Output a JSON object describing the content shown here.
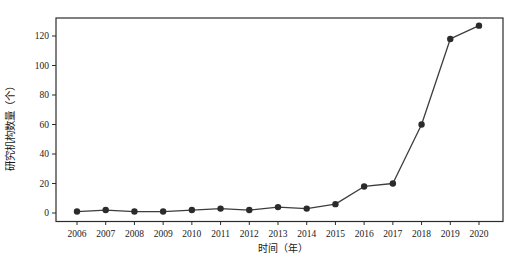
{
  "chart_data": {
    "type": "line",
    "title": "",
    "xlabel": "时间（年）",
    "ylabel": "研究机构数量（个）",
    "categories": [
      "2006",
      "2007",
      "2008",
      "2009",
      "2010",
      "2011",
      "2012",
      "2013",
      "2014",
      "2015",
      "2016",
      "2017",
      "2018",
      "2019",
      "2020"
    ],
    "x": [
      2006,
      2007,
      2008,
      2009,
      2010,
      2011,
      2012,
      2013,
      2014,
      2015,
      2016,
      2017,
      2018,
      2019,
      2020
    ],
    "series": [
      {
        "name": "研究机构数量",
        "values": [
          1,
          2,
          1,
          1,
          2,
          3,
          2,
          4,
          3,
          6,
          18,
          20,
          60,
          118,
          127
        ]
      }
    ],
    "yticks": [
      0,
      20,
      40,
      60,
      80,
      100,
      120
    ],
    "ylim": [
      -6,
      132
    ],
    "xlim": [
      2005.27,
      2020.84
    ],
    "grid": false,
    "legend": "none",
    "marker": "filled-circle",
    "colors": {
      "line": "#3d3d3d",
      "marker": "#2b2b2b",
      "frame": "#2b2b2b",
      "tick": "#2b2b2b",
      "text": "#1a1a1a",
      "background": "#ffffff"
    }
  }
}
